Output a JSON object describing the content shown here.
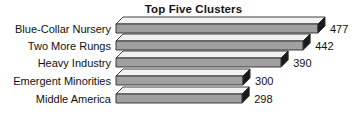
{
  "chart_data": {
    "type": "bar",
    "orientation": "horizontal",
    "style": "3d-horizontal-bar",
    "title": "Top Five Clusters",
    "xlabel": "",
    "ylabel": "",
    "categories": [
      "Blue-Collar Nursery",
      "Two More Rungs",
      "Heavy Industry",
      "Emergent Minorities",
      "Middle America"
    ],
    "values": [
      477,
      442,
      390,
      300,
      298
    ],
    "value_labels": [
      "477",
      "442",
      "390",
      "300",
      "298"
    ],
    "xlim": [
      0,
      530
    ],
    "grid": false,
    "legend": null,
    "colors": {
      "bar_front": "#a0a0a0",
      "bar_top": "#f2f2f2",
      "bar_end": "#1a1a1a",
      "outline": "#2b2b2b",
      "background": "#ffffff",
      "text": "#101010"
    }
  }
}
